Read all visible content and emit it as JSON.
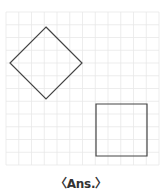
{
  "grid": {
    "x0": 6,
    "y0": 12,
    "cell": 12.75,
    "cols": 12,
    "rows": 12,
    "color": "#e8e8e8"
  },
  "shapes": [
    {
      "name": "diamond",
      "points": "46,27 82,63 46,99 10,63",
      "stroke": "#444444"
    },
    {
      "name": "square",
      "points": "96,104 147,104 147,156 96,156",
      "stroke": "#444444"
    }
  ],
  "caption": "〈Ans.〉"
}
